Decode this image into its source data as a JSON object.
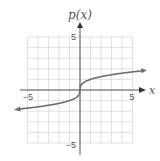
{
  "chart_data": {
    "type": "line",
    "title": "",
    "xlabel": "x",
    "ylabel": "p(x)",
    "xlim": [
      -5,
      5
    ],
    "ylim": [
      -5,
      5
    ],
    "grid": true,
    "x_tick_labels": [
      "-5",
      "5"
    ],
    "y_tick_labels": [
      "5",
      "-5"
    ],
    "series": [
      {
        "name": "p(x)",
        "function": "cube root of x",
        "x": [
          -6,
          -5,
          -4,
          -3,
          -2,
          -1,
          -0.5,
          0,
          0.5,
          1,
          2,
          3,
          4,
          5,
          6
        ],
        "y": [
          -1.82,
          -1.71,
          -1.59,
          -1.44,
          -1.26,
          -1,
          -0.79,
          0,
          0.79,
          1,
          1.26,
          1.44,
          1.59,
          1.71,
          1.82
        ],
        "arrows": "both ends",
        "color": "#6e6e6e"
      }
    ]
  },
  "labels": {
    "y_axis": "p(x)",
    "x_axis": "x",
    "x_neg": "−5",
    "x_pos": "5",
    "y_pos": "5",
    "y_neg": "−5"
  },
  "colors": {
    "grid": "#d9d9d9",
    "axis": "#555555",
    "curve": "#6e6e6e"
  }
}
